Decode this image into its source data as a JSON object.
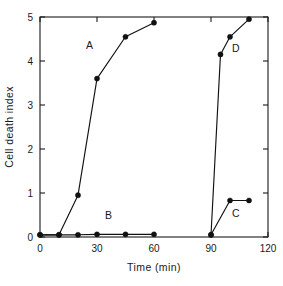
{
  "chart_data": {
    "type": "line",
    "title": "",
    "xlabel": "Time (min)",
    "ylabel": "Cell death index",
    "xlim": [
      0,
      120
    ],
    "ylim": [
      0,
      5
    ],
    "xticks": [
      0,
      30,
      60,
      90,
      120
    ],
    "xticklabels": [
      "0",
      "30",
      "60",
      "90",
      "120"
    ],
    "yticks": [
      0,
      1,
      2,
      3,
      4,
      5
    ],
    "yticklabels": [
      "0",
      "1",
      "2",
      "3",
      "4",
      "5"
    ],
    "grid": false,
    "legend_position": "inline-annotations",
    "frame": "box",
    "marker": "filled-circle",
    "series": [
      {
        "name": "A",
        "label": "A",
        "label_x": 26,
        "label_y": 4.28,
        "x": [
          0,
          10,
          20,
          30,
          45,
          60
        ],
        "y": [
          0.05,
          0.05,
          0.95,
          3.6,
          4.55,
          4.87
        ]
      },
      {
        "name": "B",
        "label": "B",
        "label_x": 36,
        "label_y": 0.42,
        "x": [
          0,
          10,
          20,
          30,
          45,
          60
        ],
        "y": [
          0.05,
          0.05,
          0.05,
          0.06,
          0.06,
          0.06
        ]
      },
      {
        "name": "C",
        "label": "C",
        "label_x": 103,
        "label_y": 0.45,
        "x": [
          90,
          100,
          110
        ],
        "y": [
          0.05,
          0.83,
          0.83
        ]
      },
      {
        "name": "D",
        "label": "D",
        "label_x": 103,
        "label_y": 4.2,
        "x": [
          90,
          95,
          100,
          110
        ],
        "y": [
          0.05,
          4.15,
          4.55,
          4.95
        ]
      }
    ]
  },
  "colors": {
    "line": "#111111",
    "marker": "#111111",
    "axis": "#1a1a1a",
    "background": "#ffffff"
  }
}
